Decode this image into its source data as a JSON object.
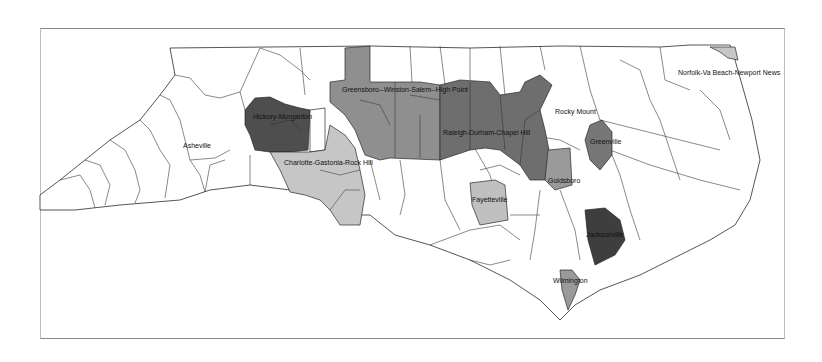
{
  "map": {
    "title": "North Carolina Metropolitan Statistical Areas",
    "colors": {
      "dark": "#4a4a4a",
      "medium_dark": "#6e6e6e",
      "medium": "#8f8f8f",
      "light": "#c6c6c6",
      "white": "#ffffff",
      "border": "#2a2a2a"
    },
    "labels": [
      {
        "id": "asheville",
        "text": "Asheville"
      },
      {
        "id": "hickory",
        "text": "Hickory-Morganton"
      },
      {
        "id": "greensboro",
        "text": "Greensboro--Winston-Salem--High Point"
      },
      {
        "id": "charlotte",
        "text": "Charlotte-Gastonia-Rock Hill"
      },
      {
        "id": "raleigh",
        "text": "Raleigh-Durham-Chapel Hill"
      },
      {
        "id": "rocky_mount",
        "text": "Rocky Mount"
      },
      {
        "id": "greenville",
        "text": "Greenville"
      },
      {
        "id": "goldsboro",
        "text": "Goldsboro"
      },
      {
        "id": "fayetteville",
        "text": "Fayetteville"
      },
      {
        "id": "jacksonville",
        "text": "Jacksonville"
      },
      {
        "id": "wilmington",
        "text": "Wilmington"
      },
      {
        "id": "norfolk",
        "text": "Norfolk-Va Beach-Newport News"
      }
    ]
  }
}
